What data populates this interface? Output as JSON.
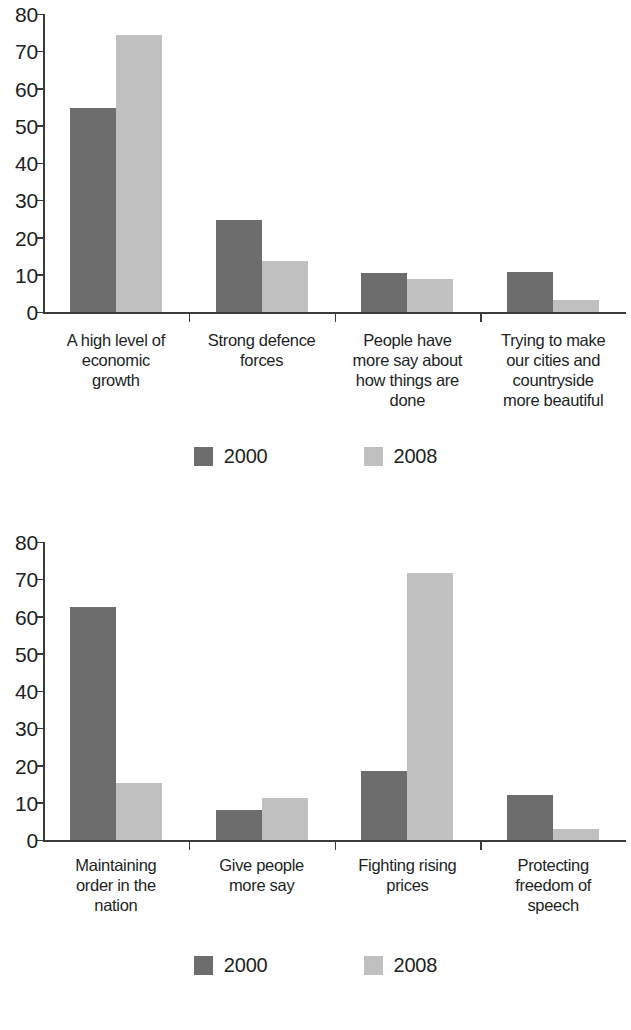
{
  "charts": [
    {
      "id": "chart-top",
      "legend": [
        {
          "label": "2000",
          "color": "#6d6d6d",
          "swatch": "legend-swatch-2000"
        },
        {
          "label": "2008",
          "color": "#c0c0c0",
          "swatch": "legend-swatch-2008"
        }
      ],
      "y_ticks": [
        "80",
        "70",
        "60",
        "50",
        "40",
        "30",
        "20",
        "10",
        "0"
      ],
      "categories": [
        "A high level of economic growth",
        "Strong defence forces",
        "People have more say about how things are done",
        "Trying to make our cities and countryside more beautiful"
      ],
      "category_lines": [
        [
          "A high level of",
          "economic",
          "growth"
        ],
        [
          "Strong defence",
          "forces"
        ],
        [
          "People have",
          "more say about",
          "how things are",
          "done"
        ],
        [
          "Trying to make",
          "our cities and",
          "countryside",
          "more beautiful"
        ]
      ]
    },
    {
      "id": "chart-bottom",
      "legend": [
        {
          "label": "2000",
          "color": "#6d6d6d",
          "swatch": "legend-swatch-2000"
        },
        {
          "label": "2008",
          "color": "#c0c0c0",
          "swatch": "legend-swatch-2008"
        }
      ],
      "y_ticks": [
        "80",
        "70",
        "60",
        "50",
        "40",
        "30",
        "20",
        "10",
        "0"
      ],
      "categories": [
        "Maintaining order in the nation",
        "Give people more say",
        "Fighting rising prices",
        "Protecting freedom of speech"
      ],
      "category_lines": [
        [
          "Maintaining",
          "order in the",
          "nation"
        ],
        [
          "Give people",
          "more say"
        ],
        [
          "Fighting rising",
          "prices"
        ],
        [
          "Protecting",
          "freedom of",
          "speech"
        ]
      ]
    }
  ],
  "chart_data": [
    {
      "type": "bar",
      "title": "",
      "xlabel": "",
      "ylabel": "",
      "ylim": [
        0,
        80
      ],
      "ytick_step": 10,
      "grid": false,
      "legend_position": "bottom-center",
      "categories": [
        "A high level of economic growth",
        "Strong defence forces",
        "People have more say about how things are done",
        "Trying to make our cities and countryside more beautiful"
      ],
      "series": [
        {
          "name": "2000",
          "color": "#6d6d6d",
          "values": [
            54.7,
            24.7,
            10.5,
            10.7
          ]
        },
        {
          "name": "2008",
          "color": "#c0c0c0",
          "values": [
            74.4,
            13.6,
            8.8,
            3.2
          ]
        }
      ]
    },
    {
      "type": "bar",
      "title": "",
      "xlabel": "",
      "ylabel": "",
      "ylim": [
        0,
        80
      ],
      "ytick_step": 10,
      "grid": false,
      "legend_position": "bottom-center",
      "categories": [
        "Maintaining order in the nation",
        "Give people more say",
        "Fighting rising prices",
        "Protecting freedom of speech"
      ],
      "series": [
        {
          "name": "2000",
          "color": "#6d6d6d",
          "values": [
            62.5,
            8.0,
            18.5,
            12.0
          ]
        },
        {
          "name": "2008",
          "color": "#c0c0c0",
          "values": [
            15.4,
            11.2,
            71.6,
            3.0
          ]
        }
      ]
    }
  ]
}
